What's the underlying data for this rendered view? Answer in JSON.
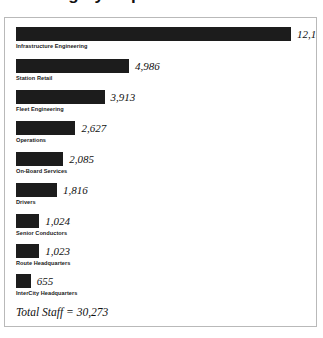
{
  "header": {
    "title": "Staffing by Department"
  },
  "chart_data": {
    "type": "bar",
    "orientation": "horizontal",
    "title": "Staffing by Department",
    "xlabel": "",
    "ylabel": "",
    "grid": false,
    "legend": null,
    "value_format": "comma",
    "bar_color": "#1c1c1c",
    "max_value": 12144,
    "categories": [
      "Infrastructure Engineering",
      "Station Retail",
      "Fleet Engineering",
      "Operations",
      "On-Board Services",
      "Drivers",
      "Senior Conductors",
      "Route Headquarters",
      "InterCity Headquarters"
    ],
    "values": [
      12144,
      4986,
      3913,
      2627,
      2085,
      1816,
      1024,
      1023,
      655
    ],
    "value_labels": [
      "12,144",
      "4,986",
      "3,913",
      "2,627",
      "2,085",
      "1,816",
      "1,024",
      "1,023",
      "655"
    ],
    "annotations": [
      {
        "name": "total",
        "text": "Total Staff = 30,273",
        "value": 30273
      }
    ]
  },
  "footer": {
    "total_text": "Total Staff = 30,273"
  }
}
